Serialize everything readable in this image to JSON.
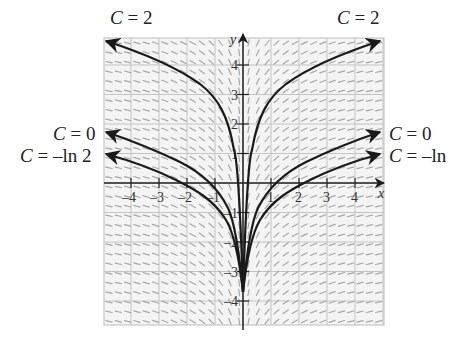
{
  "figure": {
    "type": "slope-field",
    "x_axis_label": "x",
    "y_axis_label": "y",
    "x_range": [
      -5,
      5
    ],
    "y_range": [
      -5,
      5
    ],
    "x_ticks": [
      "-4",
      "-3",
      "-2",
      "-1",
      "1",
      "2",
      "3",
      "4"
    ],
    "y_ticks": [
      "4",
      "3",
      "2",
      "1",
      "-1",
      "-2",
      "-3",
      "-4"
    ],
    "curve_color": "#1a1a1a",
    "grid_color": "#bdbdbd",
    "slope_color": "#9a9a9a"
  },
  "labels": {
    "top_left": {
      "var": "C",
      "eq": " = 2"
    },
    "top_right": {
      "var": "C",
      "eq": " = 2"
    },
    "mid_left": {
      "var": "C",
      "eq": " = 0"
    },
    "mid_right": {
      "var": "C",
      "eq": " = 0"
    },
    "low_left": {
      "var": "C",
      "eq": " = –ln 2"
    },
    "low_right": {
      "var": "C",
      "eq": " = –ln"
    }
  },
  "curves": [
    {
      "name": "C = 2"
    },
    {
      "name": "C = 0"
    },
    {
      "name": "C = -ln 2"
    }
  ]
}
